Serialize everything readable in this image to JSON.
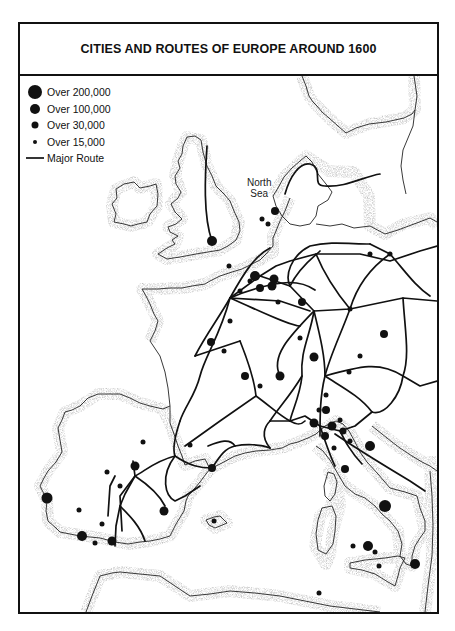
{
  "title": "CITIES AND ROUTES OF EUROPE AROUND 1600",
  "legend": {
    "items": [
      {
        "label": "Over 200,000",
        "symbol": "dot-xl"
      },
      {
        "label": "Over 100,000",
        "symbol": "dot-lg"
      },
      {
        "label": "Over 30,000",
        "symbol": "dot-md"
      },
      {
        "label": "Over 15,000",
        "symbol": "dot-sm"
      },
      {
        "label": "Major Route",
        "symbol": "line"
      }
    ]
  },
  "labels": {
    "north_sea_line1": "North",
    "north_sea_line2": "Sea"
  },
  "colors": {
    "ink": "#111111",
    "coast_stipple": "#9a9a9a",
    "paper": "#ffffff"
  }
}
